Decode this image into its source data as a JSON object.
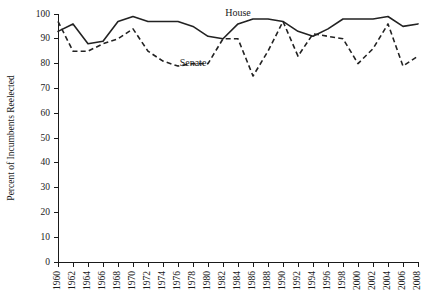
{
  "chart_data": {
    "type": "line",
    "title": "",
    "subtitle": "",
    "xlabel": "",
    "ylabel": "Percent of Incumbents Reelected",
    "xlim": [
      1960,
      2008
    ],
    "ylim": [
      0,
      100
    ],
    "ytick_step": 10,
    "xtick_step": 2,
    "grid": false,
    "legend_position": "inline-annotations",
    "x": [
      1960,
      1962,
      1964,
      1966,
      1968,
      1970,
      1972,
      1974,
      1976,
      1978,
      1980,
      1982,
      1984,
      1986,
      1988,
      1990,
      1992,
      1994,
      1996,
      1998,
      2000,
      2002,
      2004,
      2006,
      2008
    ],
    "ytick_labels": [
      "0",
      "10",
      "20",
      "30",
      "40",
      "50",
      "60",
      "70",
      "80",
      "90",
      "100"
    ],
    "xtick_labels": [
      "1960",
      "1962",
      "1964",
      "1966",
      "1968",
      "1970",
      "1972",
      "1974",
      "1976",
      "1978",
      "1980",
      "1982",
      "1984",
      "1986",
      "1988",
      "1990",
      "1992",
      "1994",
      "1996",
      "1998",
      "2000",
      "2002",
      "2004",
      "2006",
      "2008"
    ],
    "series": [
      {
        "name": "House",
        "label": "House",
        "style": "solid",
        "label_x": 1984,
        "label_y": 99,
        "values": [
          93,
          96,
          88,
          89,
          97,
          99,
          97,
          97,
          97,
          95,
          91,
          90,
          96,
          98,
          98,
          97,
          93,
          91,
          94,
          98,
          98,
          98,
          99,
          95,
          96
        ]
      },
      {
        "name": "Senate",
        "label": "Senate",
        "style": "dashed",
        "label_x": 1978,
        "label_y": 79,
        "values": [
          97,
          85,
          85,
          88,
          90,
          94,
          85,
          81,
          79,
          80,
          80,
          90,
          90,
          75,
          85,
          97,
          83,
          92,
          91,
          90,
          80,
          86,
          96,
          79,
          83
        ]
      }
    ],
    "annotations": [
      {
        "text": "House",
        "x": 1984,
        "y": 99
      },
      {
        "text": "Senate",
        "x": 1978,
        "y": 79
      }
    ]
  }
}
